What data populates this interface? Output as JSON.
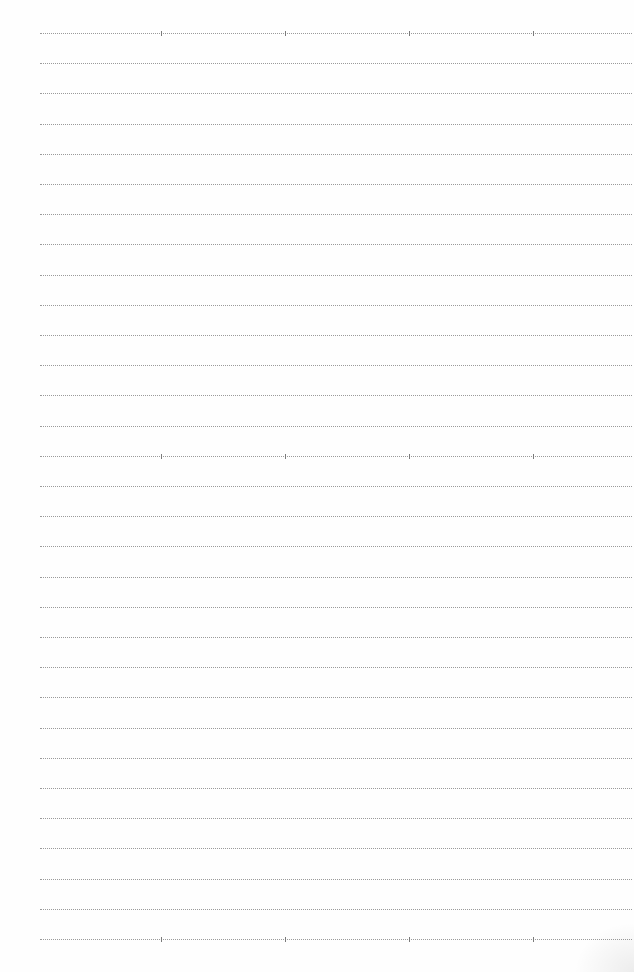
{
  "page": {
    "type": "lined-paper",
    "line_count": 31,
    "first_line_y": 33,
    "line_spacing": 30.2,
    "line_left": 40,
    "line_width": 592,
    "line_color": "#9a9a9a",
    "tick_color": "#7a7a7a",
    "tick_line_indices": [
      0,
      14,
      30
    ],
    "tick_x_positions": [
      161,
      285,
      409,
      533
    ]
  }
}
